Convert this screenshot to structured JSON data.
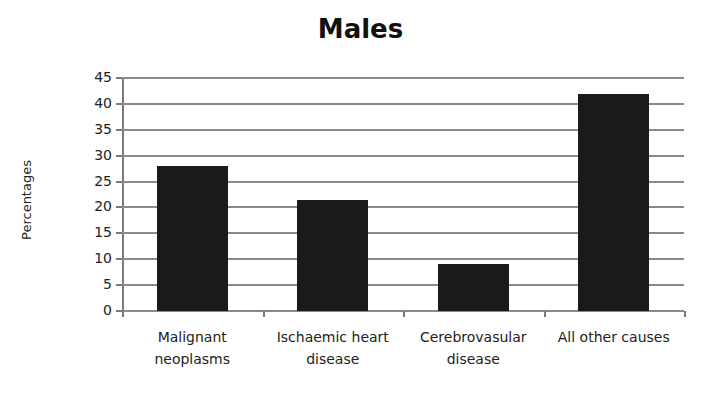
{
  "chart_data": {
    "type": "bar",
    "title": "Males",
    "xlabel": "",
    "ylabel": "Percentages",
    "categories": [
      "Malignant neoplasms",
      "Ischaemic heart disease",
      "Cerebrovasular disease",
      "All other causes"
    ],
    "category_lines": [
      [
        "Malignant",
        "neoplasms"
      ],
      [
        "Ischaemic heart",
        "disease"
      ],
      [
        "Cerebrovasular",
        "disease"
      ],
      [
        "All other causes",
        ""
      ]
    ],
    "values": [
      28,
      21.5,
      9,
      42
    ],
    "ylim": [
      0,
      45
    ],
    "yticks": [
      0,
      5,
      10,
      15,
      20,
      25,
      30,
      35,
      40,
      45
    ],
    "grid": true,
    "legend": null,
    "bar_color": "#1a1a1a"
  }
}
